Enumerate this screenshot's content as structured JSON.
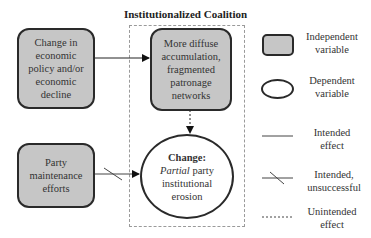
{
  "title": "Institutionalized Coalition",
  "nodes": {
    "economic_change": {
      "type": "independent",
      "lines": [
        "Change in",
        "economic",
        "policy and/or",
        "economic",
        "decline"
      ]
    },
    "diffuse_accumulation": {
      "type": "independent",
      "lines": [
        "More diffuse",
        "accumulation,",
        "fragmented",
        "patronage",
        "networks"
      ]
    },
    "party_maintenance": {
      "type": "independent",
      "lines": [
        "Party",
        "maintenance",
        "efforts"
      ]
    },
    "change": {
      "type": "dependent",
      "heading": "Change:",
      "italic_word": "Partial",
      "rest_line1": " party",
      "line2": "institutional",
      "line3": "erosion"
    }
  },
  "edges": [
    {
      "from": "economic_change",
      "to": "diffuse_accumulation",
      "style": "intended-effect"
    },
    {
      "from": "diffuse_accumulation",
      "to": "change",
      "style": "unintended-effect"
    },
    {
      "from": "party_maintenance",
      "to": "change",
      "style": "intended-unsuccessful"
    }
  ],
  "legend": {
    "independent": [
      "Independent",
      "variable"
    ],
    "dependent": [
      "Dependent",
      "variable"
    ],
    "intended": [
      "Intended",
      "effect"
    ],
    "unsuccessful": [
      "Intended,",
      "unsuccessful"
    ],
    "unintended": [
      "Unintended",
      "effect"
    ]
  },
  "colors": {
    "box_fill": "#c6c6c6",
    "stroke": "#2a2a2a",
    "frame": "#9a9a9a"
  }
}
